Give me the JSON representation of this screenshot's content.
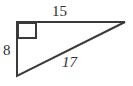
{
  "diagram": {
    "type": "right-triangle",
    "stroke_color": "#3a3a3a",
    "background_color": "#ffffff",
    "label_color": "#2e2e2e",
    "vertices": {
      "right_angle_corner": [
        17,
        22
      ],
      "top_right": [
        125,
        22
      ],
      "bottom_left": [
        17,
        76
      ]
    },
    "right_angle_marker": {
      "name": "right-angle-square",
      "x": 18,
      "y": 23,
      "size": 18
    },
    "labels": {
      "top_leg": "15",
      "left_leg": "8",
      "hypotenuse": "17"
    }
  },
  "chart_data": {
    "type": "table",
    "title": "",
    "categories": [
      "top leg",
      "left leg",
      "hypotenuse"
    ],
    "values": [
      15,
      8,
      17
    ]
  }
}
